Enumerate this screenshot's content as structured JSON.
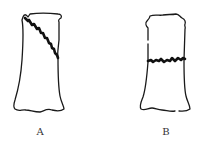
{
  "figure": {
    "panels": [
      {
        "id": "A",
        "label": "A",
        "bone": "long bone outline",
        "fracture_type": "oblique fracture"
      },
      {
        "id": "B",
        "label": "B",
        "bone": "long bone outline",
        "fracture_type": "transverse fracture"
      }
    ],
    "colors": {
      "line": "#1a1a1a",
      "fracture": "#111111",
      "background": "#ffffff",
      "label": "#333333"
    }
  }
}
